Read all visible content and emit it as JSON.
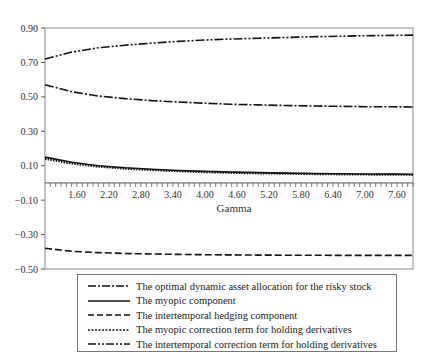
{
  "chart_data": {
    "type": "line",
    "title": "",
    "xlabel": "Gamma",
    "ylabel": "",
    "xlim": [
      1.0,
      7.9
    ],
    "ylim": [
      -0.5,
      0.9
    ],
    "grid": false,
    "legend_position": "bottom",
    "x_ticks": [
      1.6,
      2.2,
      2.8,
      3.4,
      4.0,
      4.6,
      5.2,
      5.8,
      6.4,
      7.0,
      7.6
    ],
    "x_tick_labels": [
      "1.60",
      "2.20",
      "2.80",
      "3.40",
      "4.00",
      "4.60",
      "5.20",
      "5.80",
      "6.40",
      "7.00",
      "7.60"
    ],
    "y_ticks": [
      0.9,
      0.7,
      0.5,
      0.3,
      0.1,
      -0.1,
      -0.3,
      -0.5
    ],
    "y_tick_labels": [
      "0.90",
      "0.70",
      "0.50",
      "0.30",
      "0.10",
      "−0.10",
      "−0.30",
      "−0.50"
    ],
    "x": [
      1.0,
      1.5,
      2.0,
      2.5,
      3.0,
      3.5,
      4.0,
      4.5,
      5.0,
      5.5,
      6.0,
      6.5,
      7.0,
      7.5,
      7.9
    ],
    "series": [
      {
        "name": "The optimal dynamic asset allocation for the risky stock",
        "style": "dash-dot",
        "values": [
          0.57,
          0.53,
          0.505,
          0.49,
          0.478,
          0.47,
          0.463,
          0.457,
          0.453,
          0.45,
          0.447,
          0.445,
          0.443,
          0.442,
          0.441
        ]
      },
      {
        "name": "The myopic component",
        "style": "solid",
        "values": [
          0.15,
          0.12,
          0.1,
          0.088,
          0.079,
          0.072,
          0.067,
          0.063,
          0.06,
          0.057,
          0.055,
          0.053,
          0.052,
          0.051,
          0.05
        ]
      },
      {
        "name": "The intertemporal hedging component",
        "style": "dashed",
        "values": [
          -0.38,
          -0.397,
          -0.405,
          -0.41,
          -0.413,
          -0.415,
          -0.417,
          -0.418,
          -0.419,
          -0.42,
          -0.42,
          -0.421,
          -0.421,
          -0.421,
          -0.421
        ]
      },
      {
        "name": "The myopic correction term for holding derivatives",
        "style": "dotted",
        "values": [
          0.14,
          0.113,
          0.095,
          0.083,
          0.075,
          0.068,
          0.063,
          0.059,
          0.056,
          0.054,
          0.052,
          0.05,
          0.049,
          0.048,
          0.047
        ]
      },
      {
        "name": "The intertemporal correction term for holding derivatives",
        "style": "dash-dot-dot",
        "values": [
          0.72,
          0.76,
          0.785,
          0.8,
          0.812,
          0.822,
          0.83,
          0.836,
          0.841,
          0.845,
          0.849,
          0.852,
          0.855,
          0.857,
          0.859
        ]
      }
    ]
  },
  "legend": {
    "items": [
      "The optimal dynamic asset allocation for the risky stock",
      "The myopic component",
      "The intertemporal hedging component",
      "The myopic correction term for holding derivatives",
      "The intertemporal correction term for holding derivatives"
    ]
  }
}
